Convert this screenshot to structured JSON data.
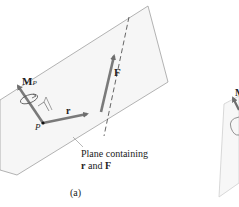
{
  "figure": {
    "panel_a": {
      "label": "(a)",
      "moment_label": "M",
      "moment_subscript": "P",
      "point_label": "P",
      "r_label": "r",
      "f_label": "F",
      "plane_caption_line1": "Plane containing",
      "plane_caption_line2_r": "r",
      "plane_caption_line2_and": " and ",
      "plane_caption_line2_f": "F"
    },
    "panel_b_partial": {
      "moment_label_fragment": "M"
    },
    "colors": {
      "plane_fill": "#f4f4f4",
      "plane_edge": "#9a9a9a",
      "vector": "#7a7a7a",
      "text": "#222222"
    }
  }
}
